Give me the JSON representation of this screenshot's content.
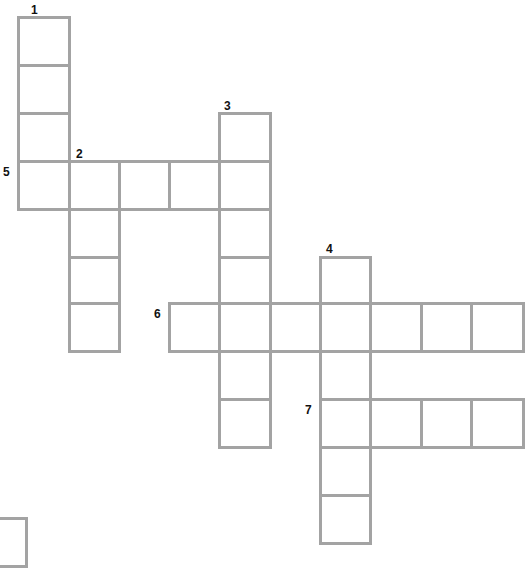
{
  "puzzle": {
    "type": "crossword",
    "border_color": "#a3a3a3",
    "clues": [
      {
        "number": "1",
        "direction": "down",
        "length": 4,
        "label_pos": [
          31,
          4
        ]
      },
      {
        "number": "2",
        "direction": "down",
        "length": 4,
        "label_pos": [
          76,
          148
        ]
      },
      {
        "number": "3",
        "direction": "down",
        "length": 7,
        "label_pos": [
          224,
          100
        ]
      },
      {
        "number": "4",
        "direction": "down",
        "length": 6,
        "label_pos": [
          326,
          243
        ]
      },
      {
        "number": "5",
        "direction": "across",
        "length": 5,
        "label_pos": [
          3,
          166
        ]
      },
      {
        "number": "6",
        "direction": "across",
        "length": 7,
        "label_pos": [
          154,
          308
        ]
      },
      {
        "number": "7",
        "direction": "across",
        "length": 4,
        "label_pos": [
          305,
          404
        ]
      }
    ],
    "cells": [
      [
        17,
        16,
        51,
        48
      ],
      [
        17,
        64,
        51,
        48
      ],
      [
        17,
        112,
        51,
        48
      ],
      [
        17,
        160,
        51,
        48
      ],
      [
        68,
        160,
        50,
        48
      ],
      [
        118,
        160,
        50,
        48
      ],
      [
        168,
        160,
        50,
        48
      ],
      [
        218,
        160,
        51,
        48
      ],
      [
        68,
        208,
        50,
        48
      ],
      [
        68,
        256,
        50,
        46
      ],
      [
        68,
        302,
        50,
        48
      ],
      [
        218,
        112,
        51,
        48
      ],
      [
        218,
        208,
        51,
        48
      ],
      [
        218,
        256,
        51,
        46
      ],
      [
        218,
        302,
        51,
        48
      ],
      [
        218,
        350,
        51,
        48
      ],
      [
        218,
        398,
        51,
        48
      ],
      [
        168,
        302,
        50,
        48
      ],
      [
        269,
        302,
        50,
        48
      ],
      [
        319,
        302,
        50,
        48
      ],
      [
        369,
        302,
        51,
        48
      ],
      [
        420,
        302,
        50,
        48
      ],
      [
        470,
        302,
        52,
        48
      ],
      [
        319,
        256,
        50,
        46
      ],
      [
        319,
        350,
        50,
        48
      ],
      [
        319,
        398,
        50,
        48
      ],
      [
        319,
        446,
        50,
        48
      ],
      [
        319,
        494,
        50,
        48
      ],
      [
        369,
        398,
        51,
        48
      ],
      [
        420,
        398,
        50,
        48
      ],
      [
        470,
        398,
        52,
        48
      ],
      [
        -30,
        517,
        55,
        48
      ]
    ]
  }
}
